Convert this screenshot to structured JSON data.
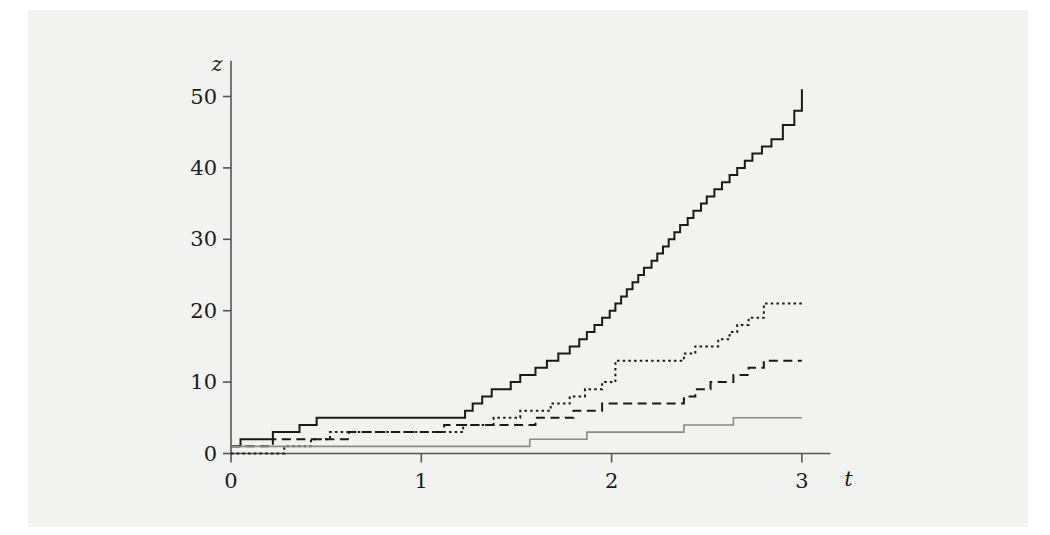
{
  "figure": {
    "background_color": "#f2f2f0",
    "page_color": "#ffffff"
  },
  "chart_data": {
    "type": "line",
    "subtype": "step",
    "title": "",
    "xlabel": "t",
    "ylabel": "z",
    "xlim": [
      0,
      3.15
    ],
    "ylim": [
      0,
      55
    ],
    "xticks": [
      0,
      1,
      2,
      3
    ],
    "xtick_labels": [
      "0",
      "1",
      "2",
      "3"
    ],
    "yticks": [
      0,
      10,
      20,
      30,
      40,
      50
    ],
    "ytick_labels": [
      "0",
      "10",
      "20",
      "30",
      "40",
      "50"
    ],
    "grid": false,
    "legend": "none",
    "axis_color": "#555555",
    "series": [
      {
        "name": "path-1",
        "style": "solid",
        "color": "#1a1a1a",
        "width": 2.0,
        "final_value": 51,
        "x": [
          0.0,
          0.03,
          0.05,
          0.2,
          0.22,
          0.3,
          0.36,
          0.4,
          0.45,
          1.17,
          1.23,
          1.27,
          1.32,
          1.37,
          1.42,
          1.47,
          1.52,
          1.6,
          1.66,
          1.72,
          1.78,
          1.83,
          1.87,
          1.91,
          1.95,
          1.99,
          2.02,
          2.05,
          2.08,
          2.11,
          2.14,
          2.17,
          2.21,
          2.24,
          2.27,
          2.3,
          2.33,
          2.36,
          2.4,
          2.43,
          2.47,
          2.5,
          2.54,
          2.58,
          2.62,
          2.66,
          2.7,
          2.74,
          2.79,
          2.84,
          2.9,
          2.96,
          3.0
        ],
        "y": [
          1,
          1,
          2,
          2,
          3,
          3,
          4,
          4,
          5,
          5,
          6,
          7,
          8,
          9,
          9,
          10,
          11,
          12,
          13,
          14,
          15,
          16,
          17,
          18,
          19,
          20,
          21,
          22,
          23,
          24,
          25,
          26,
          27,
          28,
          29,
          30,
          31,
          32,
          33,
          34,
          35,
          36,
          37,
          38,
          39,
          40,
          41,
          42,
          43,
          44,
          46,
          48,
          51
        ]
      },
      {
        "name": "path-2",
        "style": "dotted",
        "color": "#1a1a1a",
        "width": 2.0,
        "final_value": 21,
        "x": [
          0.0,
          0.24,
          0.28,
          0.33,
          0.42,
          0.48,
          0.52,
          0.6,
          1.17,
          1.22,
          1.3,
          1.38,
          1.45,
          1.52,
          1.6,
          1.68,
          1.78,
          1.86,
          1.95,
          2.02,
          2.3,
          2.38,
          2.44,
          2.5,
          2.56,
          2.62,
          2.66,
          2.72,
          2.8,
          3.0
        ],
        "y": [
          0,
          0,
          1,
          1,
          2,
          2,
          3,
          3,
          3,
          4,
          4,
          5,
          5,
          6,
          6,
          7,
          8,
          9,
          10,
          13,
          13,
          14,
          15,
          15,
          16,
          17,
          18,
          19,
          21,
          21
        ]
      },
      {
        "name": "path-3",
        "style": "dashed",
        "color": "#1a1a1a",
        "width": 2.0,
        "final_value": 13,
        "x": [
          0.0,
          0.16,
          0.22,
          0.35,
          0.55,
          0.62,
          1.05,
          1.12,
          1.52,
          1.6,
          1.72,
          1.8,
          1.88,
          1.95,
          2.08,
          2.3,
          2.38,
          2.44,
          2.52,
          2.58,
          2.64,
          2.72,
          2.8,
          3.0
        ],
        "y": [
          1,
          1,
          2,
          2,
          2,
          3,
          3,
          4,
          4,
          5,
          5,
          6,
          6,
          7,
          7,
          7,
          8,
          9,
          10,
          10,
          11,
          12,
          13,
          13
        ]
      },
      {
        "name": "path-4",
        "style": "solid",
        "color": "#8a8a8a",
        "width": 1.6,
        "final_value": 5,
        "x": [
          0.0,
          1.57,
          1.87,
          2.38,
          2.64,
          3.0
        ],
        "y": [
          1,
          2,
          3,
          4,
          5,
          5
        ]
      }
    ]
  }
}
